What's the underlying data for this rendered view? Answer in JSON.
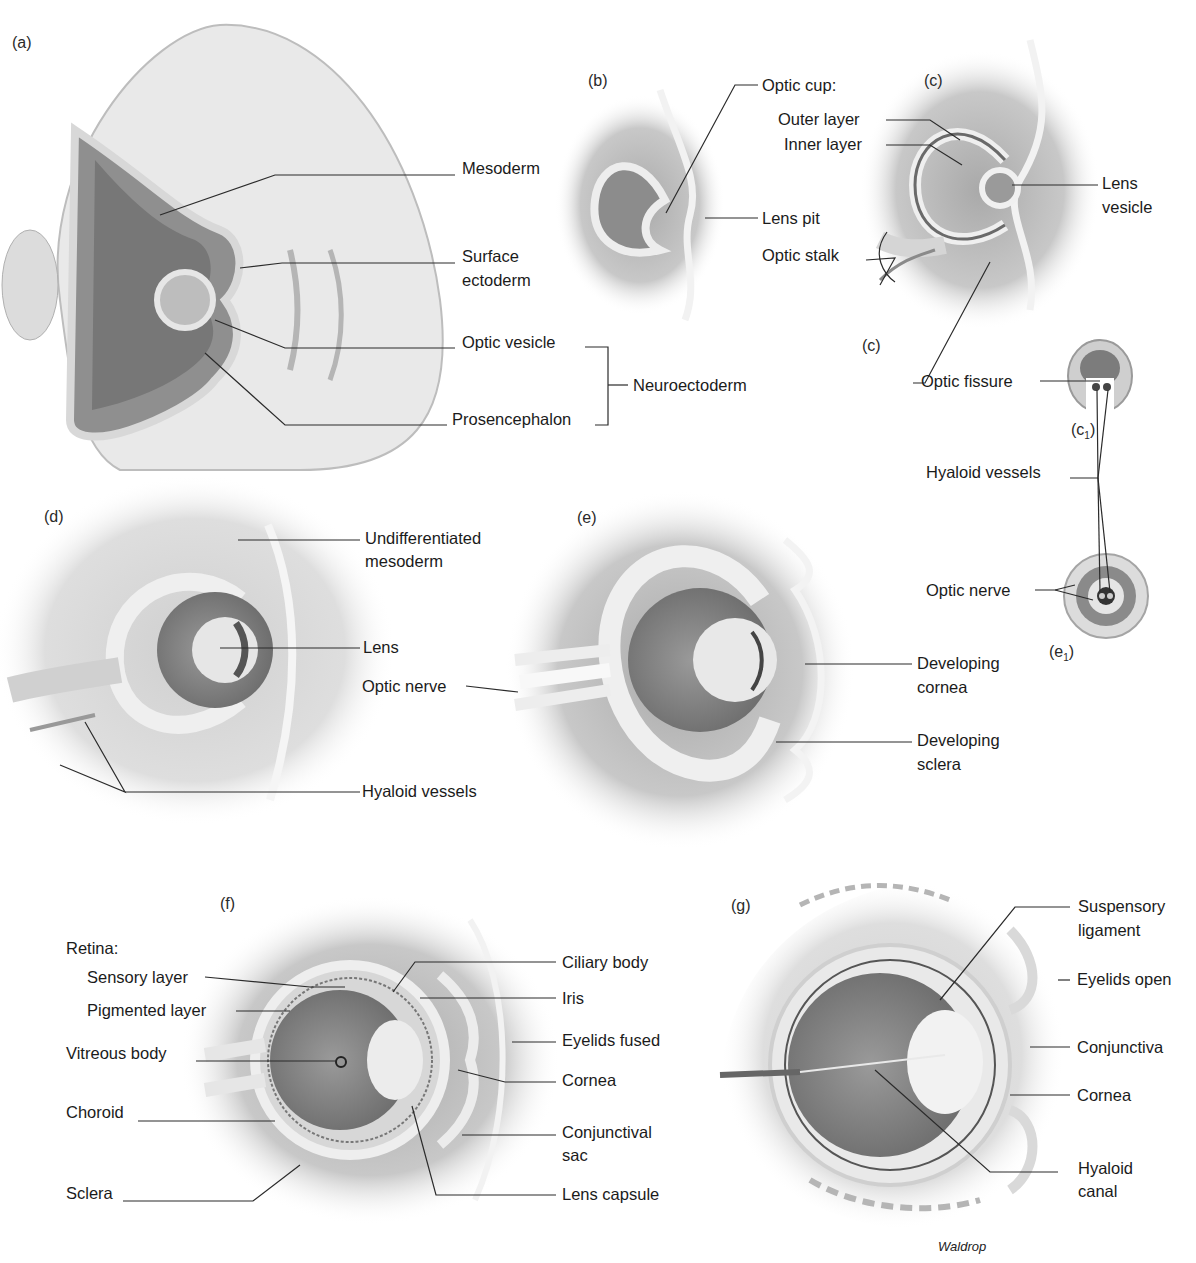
{
  "figure": {
    "credit": "Waldrop"
  },
  "panels": {
    "a": {
      "tag": "(a)",
      "labels": {
        "mesoderm": "Mesoderm",
        "surface_ectoderm_1": "Surface",
        "surface_ectoderm_2": "ectoderm",
        "optic_vesicle": "Optic vesicle",
        "prosencephalon": "Prosencephalon",
        "neuroectoderm": "Neuroectoderm"
      }
    },
    "b": {
      "tag": "(b)",
      "labels": {
        "optic_cup": "Optic cup:",
        "lens_pit": "Lens pit"
      }
    },
    "c": {
      "tag": "(c)",
      "labels": {
        "outer_layer": "Outer layer",
        "inner_layer": "Inner layer",
        "lens_vesicle_1": "Lens",
        "lens_vesicle_2": "vesicle",
        "optic_stalk": "Optic stalk",
        "section_ref": "(c)",
        "optic_fissure": "Optic fissure"
      }
    },
    "c1": {
      "tag_base": "(c",
      "tag_sub": "1",
      "tag_end": ")",
      "labels": {
        "hyaloid_vessels": "Hyaloid vessels"
      }
    },
    "d": {
      "tag": "(d)",
      "labels": {
        "undifferentiated_1": "Undifferentiated",
        "undifferentiated_2": "mesoderm",
        "lens": "Lens",
        "optic_nerve": "Optic nerve",
        "hyaloid_vessels": "Hyaloid vessels"
      }
    },
    "e": {
      "tag": "(e)",
      "labels": {
        "developing_cornea_1": "Developing",
        "developing_cornea_2": "cornea",
        "developing_sclera_1": "Developing",
        "developing_sclera_2": "sclera"
      }
    },
    "e1": {
      "tag_base": "(e",
      "tag_sub": "1",
      "tag_end": ")",
      "labels": {
        "optic_nerve": "Optic nerve"
      }
    },
    "f": {
      "tag": "(f)",
      "labels": {
        "retina": "Retina:",
        "sensory_layer": "Sensory layer",
        "pigmented_layer": "Pigmented layer",
        "vitreous_body": "Vitreous body",
        "choroid": "Choroid",
        "sclera": "Sclera",
        "ciliary_body": "Ciliary body",
        "iris": "Iris",
        "eyelids_fused": "Eyelids fused",
        "cornea": "Cornea",
        "conjunctival_sac_1": "Conjunctival",
        "conjunctival_sac_2": "sac",
        "lens_capsule": "Lens capsule"
      }
    },
    "g": {
      "tag": "(g)",
      "labels": {
        "suspensory_ligament_1": "Suspensory",
        "suspensory_ligament_2": "ligament",
        "eyelids_open": "Eyelids open",
        "conjunctiva": "Conjunctiva",
        "cornea": "Cornea",
        "hyaloid_canal_1": "Hyaloid",
        "hyaloid_canal_2": "canal"
      }
    }
  },
  "colors": {
    "background": "#ffffff",
    "tissue_light": "#e6e6e6",
    "tissue_mid": "#bdbdbd",
    "tissue_dark": "#8a8a8a",
    "leader_line": "#2b2b2b",
    "text": "#1b1b1b"
  }
}
